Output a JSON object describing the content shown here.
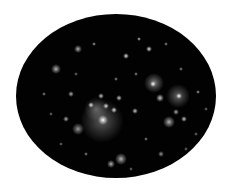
{
  "image": {
    "description": "Oval-cropped deep-field image of a galaxy cluster on white background",
    "background_color": "#ffffff",
    "field_color": "#020202",
    "ellipse": {
      "left": 16,
      "top": 14,
      "width": 200,
      "height": 164
    }
  },
  "objects": [
    {
      "x": 86,
      "y": 107,
      "r": 22,
      "a": 0.35
    },
    {
      "x": 87,
      "y": 106,
      "r": 5,
      "a": 1.0
    },
    {
      "x": 80,
      "y": 95,
      "r": 12,
      "a": 0.3
    },
    {
      "x": 75,
      "y": 91,
      "r": 3,
      "a": 0.9
    },
    {
      "x": 90,
      "y": 92,
      "r": 3,
      "a": 0.9
    },
    {
      "x": 98,
      "y": 96,
      "r": 3,
      "a": 0.9
    },
    {
      "x": 103,
      "y": 84,
      "r": 3,
      "a": 0.8
    },
    {
      "x": 119,
      "y": 97,
      "r": 3,
      "a": 0.8
    },
    {
      "x": 85,
      "y": 82,
      "r": 3,
      "a": 0.8
    },
    {
      "x": 62,
      "y": 115,
      "r": 6,
      "a": 0.6
    },
    {
      "x": 105,
      "y": 145,
      "r": 6,
      "a": 0.7
    },
    {
      "x": 95,
      "y": 150,
      "r": 4,
      "a": 0.7
    },
    {
      "x": 138,
      "y": 69,
      "r": 10,
      "a": 0.5
    },
    {
      "x": 137,
      "y": 70,
      "r": 3,
      "a": 1.0
    },
    {
      "x": 144,
      "y": 84,
      "r": 4,
      "a": 0.8
    },
    {
      "x": 162,
      "y": 82,
      "r": 12,
      "a": 0.4
    },
    {
      "x": 163,
      "y": 82,
      "r": 3,
      "a": 1.0
    },
    {
      "x": 153,
      "y": 108,
      "r": 6,
      "a": 0.7
    },
    {
      "x": 168,
      "y": 105,
      "r": 3,
      "a": 0.8
    },
    {
      "x": 160,
      "y": 98,
      "r": 3,
      "a": 0.7
    },
    {
      "x": 40,
      "y": 55,
      "r": 5,
      "a": 0.7
    },
    {
      "x": 133,
      "y": 35,
      "r": 3,
      "a": 0.9
    },
    {
      "x": 110,
      "y": 42,
      "r": 3,
      "a": 0.9
    },
    {
      "x": 62,
      "y": 35,
      "r": 4,
      "a": 0.7
    },
    {
      "x": 55,
      "y": 80,
      "r": 3,
      "a": 0.7
    },
    {
      "x": 50,
      "y": 105,
      "r": 3,
      "a": 0.7
    },
    {
      "x": 182,
      "y": 78,
      "r": 2,
      "a": 0.7
    },
    {
      "x": 165,
      "y": 55,
      "r": 2,
      "a": 0.6
    },
    {
      "x": 123,
      "y": 25,
      "r": 2,
      "a": 0.8
    },
    {
      "x": 145,
      "y": 140,
      "r": 3,
      "a": 0.6
    },
    {
      "x": 130,
      "y": 125,
      "r": 2,
      "a": 0.6
    },
    {
      "x": 28,
      "y": 80,
      "r": 2,
      "a": 0.6
    },
    {
      "x": 78,
      "y": 30,
      "r": 2,
      "a": 0.7
    },
    {
      "x": 180,
      "y": 120,
      "r": 2,
      "a": 0.5
    },
    {
      "x": 70,
      "y": 140,
      "r": 2,
      "a": 0.6
    },
    {
      "x": 115,
      "y": 155,
      "r": 2,
      "a": 0.5
    },
    {
      "x": 45,
      "y": 130,
      "r": 2,
      "a": 0.5
    },
    {
      "x": 150,
      "y": 30,
      "r": 2,
      "a": 0.6
    },
    {
      "x": 190,
      "y": 95,
      "r": 2,
      "a": 0.5
    },
    {
      "x": 100,
      "y": 65,
      "r": 2,
      "a": 0.6
    },
    {
      "x": 120,
      "y": 60,
      "r": 2,
      "a": 0.6
    },
    {
      "x": 35,
      "y": 100,
      "r": 2,
      "a": 0.5
    },
    {
      "x": 170,
      "y": 135,
      "r": 2,
      "a": 0.5
    },
    {
      "x": 60,
      "y": 60,
      "r": 2,
      "a": 0.5
    }
  ]
}
